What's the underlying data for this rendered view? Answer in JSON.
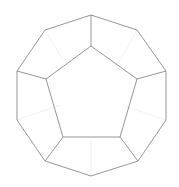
{
  "diagram": {
    "shape": "dodecahedron",
    "colors": {
      "edge": "#8a8a8a",
      "hidden_edge": "#ececec",
      "background": "#ffffff"
    },
    "outer_vertices": [
      [
        91,
        15
      ],
      [
        137,
        30
      ],
      [
        166,
        71
      ],
      [
        166,
        120
      ],
      [
        138,
        161
      ],
      [
        91,
        176
      ],
      [
        45,
        161
      ],
      [
        17,
        120
      ],
      [
        17,
        71
      ],
      [
        45,
        30
      ]
    ],
    "inner_vertices": [
      [
        91,
        46
      ],
      [
        137,
        79
      ],
      [
        120,
        137
      ],
      [
        63,
        137
      ],
      [
        46,
        79
      ]
    ],
    "spokes": [
      [
        0,
        0
      ],
      [
        2,
        1
      ],
      [
        4,
        2
      ],
      [
        6,
        3
      ],
      [
        8,
        4
      ]
    ],
    "hidden_edges": [
      [
        [
          91,
          176
        ],
        [
          91,
          140
        ]
      ],
      [
        [
          17,
          120
        ],
        [
          60,
          105
        ]
      ],
      [
        [
          166,
          120
        ],
        [
          122,
          105
        ]
      ],
      [
        [
          45,
          30
        ],
        [
          63,
          60
        ]
      ],
      [
        [
          137,
          30
        ],
        [
          120,
          60
        ]
      ]
    ]
  }
}
